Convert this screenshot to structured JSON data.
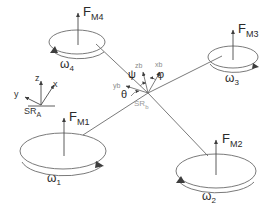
{
  "figure": {
    "type": "quadrotor-schematic"
  },
  "rotors": [
    {
      "id": "rotor-1",
      "force_label": "F",
      "force_sub": "M1",
      "omega_label": "ω",
      "omega_sub": "1",
      "spin": "clockwise"
    },
    {
      "id": "rotor-2",
      "force_label": "F",
      "force_sub": "M2",
      "omega_label": "ω",
      "omega_sub": "2",
      "spin": "counter-clockwise"
    },
    {
      "id": "rotor-3",
      "force_label": "F",
      "force_sub": "M3",
      "omega_label": "ω",
      "omega_sub": "3",
      "spin": "clockwise"
    },
    {
      "id": "rotor-4",
      "force_label": "F",
      "force_sub": "M4",
      "omega_label": "ω",
      "omega_sub": "4",
      "spin": "counter-clockwise"
    }
  ],
  "inertial_frame": {
    "name": "SR",
    "name_sub": "A",
    "axes": {
      "x": "x",
      "y": "y",
      "z": "z"
    }
  },
  "body_frame": {
    "name": "SR",
    "name_sub": "b",
    "axes": {
      "xb": "xb",
      "yb": "yb",
      "zb": "zb"
    },
    "euler_angles": {
      "yaw": "ψ",
      "pitch": "θ",
      "roll": "φ"
    }
  },
  "colors": {
    "stroke": "#4a4a4a",
    "text": "#2b2b2b",
    "muted": "#9a9a9a",
    "background": "#ffffff"
  }
}
